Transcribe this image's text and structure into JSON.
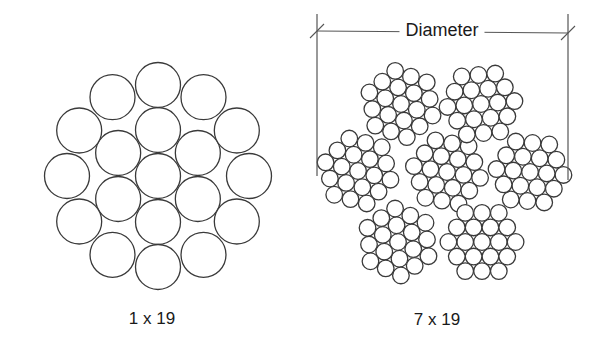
{
  "diagram": {
    "left_figure": {
      "label": "1 x 19",
      "label_pos": [
        152,
        309
      ],
      "center": [
        158,
        176
      ],
      "wire_radius": 22.5,
      "rings": [
        {
          "count": 1,
          "distance": 0,
          "phase_deg": 0
        },
        {
          "count": 6,
          "distance": 46,
          "phase_deg": 90
        },
        {
          "count": 12,
          "distance": 91,
          "phase_deg": 90
        }
      ]
    },
    "right_figure": {
      "label": "7 x 19",
      "label_pos": [
        437,
        310
      ],
      "wire_radius": 8.3,
      "wire_pitch": 16.8,
      "strands": [
        {
          "name": "center",
          "center": [
            447,
            172
          ],
          "rot_deg": 10
        },
        {
          "name": "top-left",
          "center": [
            401,
            104
          ],
          "rot_deg": 20
        },
        {
          "name": "top-right",
          "center": [
            481,
            104
          ],
          "rot_deg": -5
        },
        {
          "name": "left",
          "center": [
            358,
            171
          ],
          "rot_deg": 15
        },
        {
          "name": "right",
          "center": [
            530,
            172
          ],
          "rot_deg": 5
        },
        {
          "name": "bottom-left",
          "center": [
            398,
            242
          ],
          "rot_deg": 25
        },
        {
          "name": "bottom-right",
          "center": [
            482,
            242
          ],
          "rot_deg": 0
        }
      ]
    },
    "dimension": {
      "label": "Diameter",
      "label_pos": [
        442,
        30
      ],
      "left_x": 317,
      "right_x": 568,
      "line_y_left": 31,
      "line_y_right": 33,
      "ext_top": 14,
      "ext_bottom_left": 176,
      "ext_bottom_right": 180
    },
    "colors": {
      "stroke": "#3a3a3a",
      "dimension_stroke": "#555555",
      "background": "#ffffff"
    }
  }
}
